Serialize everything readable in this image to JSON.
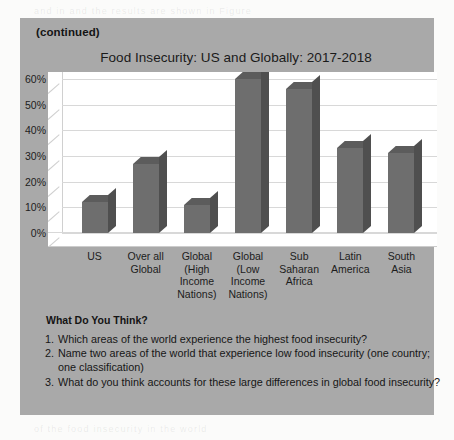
{
  "panel": {
    "continued_label": "(continued)"
  },
  "chart_data": {
    "type": "bar",
    "title": "Food Insecurity: US and Globally: 2017-2018",
    "xlabel": "",
    "ylabel": "",
    "ylim": [
      0,
      60
    ],
    "ytick_labels": [
      "60%",
      "50%",
      "40%",
      "30%",
      "20%",
      "10%",
      "0%"
    ],
    "ytick_values": [
      60,
      50,
      40,
      30,
      20,
      10,
      0
    ],
    "grid": true,
    "legend": "none",
    "three_d": true,
    "categories": [
      "US",
      "Over all Global",
      "Global (High Income Nations)",
      "Global (Low Income Nations)",
      "Sub Saharan Africa",
      "Latin America",
      "South Asia"
    ],
    "category_lines": [
      [
        "US"
      ],
      [
        "Over all",
        "Global"
      ],
      [
        "Global",
        "(High",
        "Income",
        "Nations)"
      ],
      [
        "Global",
        "(Low",
        "Income",
        "Nations)"
      ],
      [
        "Sub",
        "Saharan",
        "Africa"
      ],
      [
        "Latin",
        "America"
      ],
      [
        "South",
        "Asia"
      ]
    ],
    "values": [
      12,
      27,
      11,
      60,
      56,
      33,
      31
    ],
    "bar_color": "#6e6e6e",
    "plot_background": "#ffffff",
    "panel_background": "#a9a9a9"
  },
  "questions": {
    "heading": "What Do You Think?",
    "items": [
      {
        "num": "1.",
        "text": "Which areas of the world experience the highest food insecurity?"
      },
      {
        "num": "2.",
        "text": "Name two areas of the world that experience low food insecurity (one country; one classification)"
      },
      {
        "num": "3.",
        "text": "What do you think accounts for these large differences in global food insecurity?"
      }
    ]
  },
  "ghost_text": {
    "top": "and in and the results are shown in Figure",
    "bottom": "of the food insecurity in the world"
  }
}
